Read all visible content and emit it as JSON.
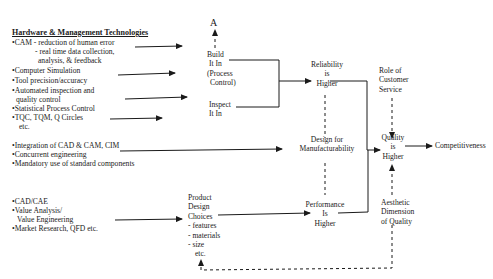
{
  "diagram": {
    "left_column": {
      "heading": "Hardware & Management Technologies",
      "group1": [
        "•CAM - reduction of human error",
        "- real time data collection,",
        "analysis, & feedback",
        "•Computer Simulation",
        "•Tool precision/accuracy",
        "•Automated inspection and",
        "quality control",
        "•Statistical Process Control",
        "•TQC, TQM, Q Circles",
        "etc."
      ],
      "group2": [
        "•Integration of CAD & CAM, CIM",
        "•Concurrent engineering",
        "•Mandatory use of standard components"
      ],
      "group3": [
        "•CAD/CAE",
        "•Value Analysis/",
        "Value Engineering",
        "•Market Research, QFD etc."
      ]
    },
    "nodes": {
      "a_marker": "A",
      "build_it_in": [
        "Build",
        "It In",
        "(Process",
        "Control)"
      ],
      "inspect_it_in": [
        "Inspect",
        "It In"
      ],
      "reliability": [
        "Reliability",
        "is",
        "Higher"
      ],
      "design_for_manufacturability": [
        "Design for",
        "Manufacturability"
      ],
      "product_design_choices": [
        "Product",
        "Design",
        "Choices",
        "- features",
        "- materials",
        "- size",
        "etc."
      ],
      "performance": [
        "Performance",
        "Is",
        "Higher"
      ],
      "role_of_customer_service": [
        "Role of",
        "Customer",
        "Service"
      ],
      "quality": [
        "Quality",
        "is",
        "Higher"
      ],
      "aesthetic": [
        "Aesthetic",
        "Dimension",
        "of Quality"
      ],
      "competitiveness": "Competitiveness"
    },
    "colors": {
      "ink": "#1a1a1a",
      "background": "#ffffff"
    }
  }
}
